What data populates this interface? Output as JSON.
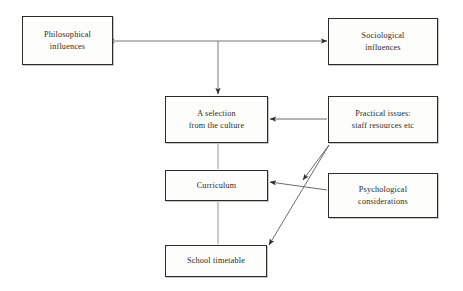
{
  "diagram": {
    "canvas": {
      "width": 463,
      "height": 291,
      "background": "#ffffff"
    },
    "style": {
      "box_border_color": "#2b2b2b",
      "box_fill_color": "#fdfdfb",
      "connector_color": "#4a4a4a",
      "text_color": "#2a2a2a"
    },
    "nodes": [
      {
        "id": "philosophical",
        "line1": "Philosophical",
        "line2": "influences",
        "x": 22,
        "y": 16,
        "w": 91,
        "h": 49
      },
      {
        "id": "sociological",
        "line1": "Sociological",
        "line2": "influences",
        "x": 328,
        "y": 18,
        "w": 110,
        "h": 47
      },
      {
        "id": "selection",
        "line1": "A selection",
        "line2": "from the culture",
        "x": 165,
        "y": 96,
        "w": 103,
        "h": 47
      },
      {
        "id": "practical",
        "line1": "Practical issues:",
        "line2": "staff resources etc",
        "x": 328,
        "y": 96,
        "w": 110,
        "h": 47
      },
      {
        "id": "curriculum",
        "line1": "Curriculum",
        "line2": "",
        "x": 165,
        "y": 170,
        "w": 103,
        "h": 31
      },
      {
        "id": "psychological",
        "line1": "Psychological",
        "line2": "considerations",
        "x": 328,
        "y": 173,
        "w": 110,
        "h": 45
      },
      {
        "id": "timetable",
        "line1": "School timetable",
        "line2": "",
        "x": 165,
        "y": 245,
        "w": 102,
        "h": 32
      }
    ],
    "connectors": [
      {
        "id": "philosophical-sociological",
        "from": "philosophical",
        "to": "sociological",
        "kind": "double-arrow-horizontal",
        "points": "113,41 328,41"
      },
      {
        "id": "crossbar-to-selection",
        "from": "philosophical-sociological",
        "to": "selection",
        "kind": "arrow-down",
        "points": "218,41 218,95"
      },
      {
        "id": "practical-to-selection",
        "from": "practical",
        "to": "selection",
        "kind": "arrow-left",
        "points": "328,119 269,119"
      },
      {
        "id": "selection-to-curriculum",
        "from": "selection",
        "to": "curriculum",
        "kind": "plain-line",
        "points": "218,143 218,170"
      },
      {
        "id": "psychological-to-curriculum",
        "from": "psychological",
        "to": "curriculum",
        "kind": "arrow-left-diagonal",
        "points": "328,190 269,182"
      },
      {
        "id": "practical-to-timetable",
        "from": "practical",
        "to": "timetable",
        "kind": "arrow-diagonal-down",
        "points": "329,144 268,246"
      },
      {
        "id": "practical-midpoint-arrow",
        "from": "practical",
        "to": "curriculum-area",
        "kind": "arrow-diagonal-down-short",
        "points": "329,144 302,181"
      },
      {
        "id": "curriculum-to-timetable",
        "from": "curriculum",
        "to": "timetable",
        "kind": "plain-line",
        "points": "218,201 218,245"
      }
    ]
  }
}
